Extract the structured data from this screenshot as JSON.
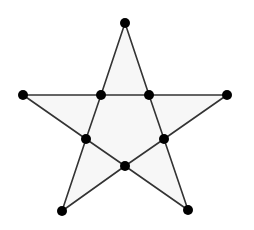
{
  "diagram": {
    "type": "pentagram-graph",
    "colors": {
      "background": "#ffffff",
      "fill": "#f7f7f7",
      "edge": "#333333",
      "node": "#000000"
    },
    "node_radius": 5,
    "edge_width": 1.6,
    "nodes": [
      {
        "id": "outer-top",
        "x": 125,
        "y": 23
      },
      {
        "id": "outer-right",
        "x": 227,
        "y": 95
      },
      {
        "id": "outer-bottom-right",
        "x": 188,
        "y": 210
      },
      {
        "id": "outer-bottom-left",
        "x": 62,
        "y": 211
      },
      {
        "id": "outer-left",
        "x": 23,
        "y": 95
      },
      {
        "id": "inner-top-left",
        "x": 101,
        "y": 95
      },
      {
        "id": "inner-top-right",
        "x": 149,
        "y": 95
      },
      {
        "id": "inner-right",
        "x": 164,
        "y": 139
      },
      {
        "id": "inner-bottom",
        "x": 125,
        "y": 166
      },
      {
        "id": "inner-left",
        "x": 86,
        "y": 139
      }
    ],
    "edges": [
      [
        "outer-top",
        "inner-top-left"
      ],
      [
        "inner-top-left",
        "inner-left"
      ],
      [
        "inner-left",
        "outer-bottom-left"
      ],
      [
        "outer-top",
        "inner-top-right"
      ],
      [
        "inner-top-right",
        "inner-right"
      ],
      [
        "inner-right",
        "outer-bottom-right"
      ],
      [
        "outer-left",
        "inner-top-left"
      ],
      [
        "inner-top-left",
        "inner-top-right"
      ],
      [
        "inner-top-right",
        "outer-right"
      ],
      [
        "outer-left",
        "inner-left"
      ],
      [
        "inner-left",
        "inner-bottom"
      ],
      [
        "inner-bottom",
        "outer-bottom-right"
      ],
      [
        "outer-right",
        "inner-right"
      ],
      [
        "inner-right",
        "inner-bottom"
      ],
      [
        "inner-bottom",
        "outer-bottom-left"
      ]
    ],
    "outline_order": [
      "outer-top",
      "inner-top-right",
      "outer-right",
      "inner-right",
      "outer-bottom-right",
      "inner-bottom",
      "outer-bottom-left",
      "inner-left",
      "outer-left",
      "inner-top-left"
    ]
  }
}
